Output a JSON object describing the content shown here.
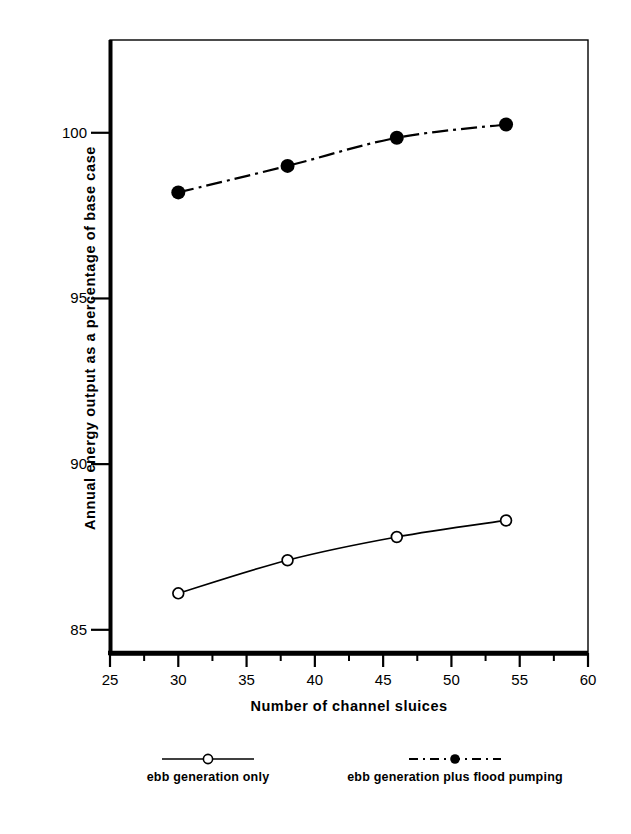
{
  "chart_data": {
    "type": "line",
    "title": "",
    "xlabel": "Number of channel sluices",
    "ylabel": "Annual energy output as a percentage of base case",
    "xlim": [
      25,
      60
    ],
    "ylim": [
      84.3,
      102.8
    ],
    "xticks": [
      25,
      30,
      35,
      40,
      45,
      50,
      55,
      60
    ],
    "xtick_labels": [
      "25",
      "30",
      "35",
      "40",
      "45",
      "50",
      "55",
      "60"
    ],
    "xminor_ticks": [
      27.5,
      32.5,
      37.5,
      42.5,
      47.5,
      52.5,
      57.5
    ],
    "yticks": [
      85,
      90,
      95,
      100
    ],
    "ytick_labels": [
      "85",
      "90",
      "95",
      "100"
    ],
    "grid": false,
    "legend_position": "below",
    "x": [
      30,
      38,
      46,
      54
    ],
    "series": [
      {
        "name": "ebb generation only",
        "marker": "open-circle",
        "linestyle": "solid",
        "color": "#000000",
        "values": [
          86.1,
          87.1,
          87.8,
          88.3
        ]
      },
      {
        "name": "ebb generation plus flood pumping",
        "marker": "filled-circle",
        "linestyle": "dash-dot",
        "color": "#000000",
        "values": [
          98.2,
          99.0,
          99.85,
          100.25
        ]
      }
    ]
  },
  "legend": {
    "entries": [
      {
        "label": "ebb generation only"
      },
      {
        "label": "ebb generation plus flood pumping"
      }
    ]
  },
  "colors": {
    "ink": "#000000",
    "background": "#ffffff"
  }
}
